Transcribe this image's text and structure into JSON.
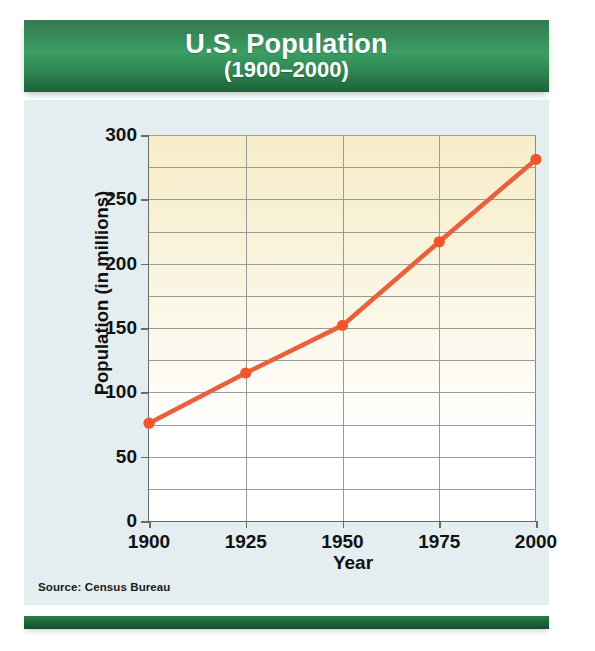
{
  "header": {
    "title": "U.S. Population",
    "subtitle": "(1900–2000)"
  },
  "source_note": "Source: Census Bureau",
  "colors": {
    "banner_green": "#2c8350",
    "bottom_bar_green": "#1d6138",
    "panel_background": "#e4eef0",
    "plot_top_fill": "#f6edc8",
    "plot_bottom_fill": "#ffffff",
    "line": "#e8603c",
    "marker": "#f1562a",
    "gridline": "#9a9a9a",
    "axis": "#6a6a6a",
    "text": "#111111"
  },
  "chart_data": {
    "type": "line",
    "title": "U.S. Population",
    "subtitle": "(1900–2000)",
    "xlabel": "Year",
    "ylabel": "Population (in millions)",
    "x": [
      1900,
      1925,
      1950,
      1975,
      2000
    ],
    "values": [
      76,
      115,
      152,
      217,
      281
    ],
    "series": [
      {
        "name": "U.S. Population",
        "values": [
          76,
          115,
          152,
          217,
          281
        ]
      }
    ],
    "xlim": [
      1900,
      2000
    ],
    "ylim": [
      0,
      300
    ],
    "xticks": [
      1900,
      1925,
      1950,
      1975,
      2000
    ],
    "xtick_labels": [
      "1900",
      "1925",
      "1950",
      "1975",
      "2000"
    ],
    "yticks": [
      0,
      50,
      100,
      150,
      200,
      250,
      300
    ],
    "ytick_labels": [
      "0",
      "50",
      "100",
      "150",
      "200",
      "250",
      "300"
    ],
    "y_minor_gridlines": [
      25,
      75,
      125,
      175,
      225,
      275
    ],
    "grid": true,
    "legend": false,
    "legend_position": "none",
    "markers": true,
    "source": "Source: Census Bureau"
  }
}
